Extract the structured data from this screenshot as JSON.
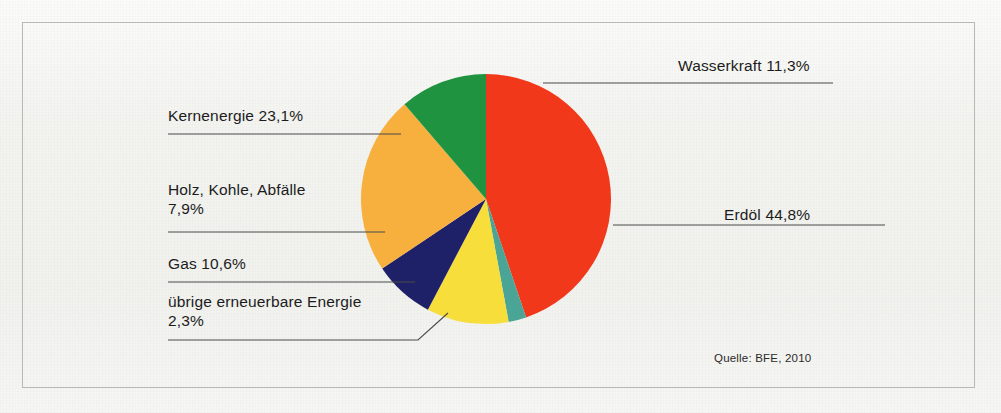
{
  "chart_data": {
    "type": "pie",
    "title": "",
    "subtitle": "",
    "xlabel": "",
    "ylabel": "",
    "legend_position": "callout-labels",
    "grid": false,
    "unit": "%",
    "total": 100.0,
    "categories": [
      "Erdöl",
      "Kernenergie",
      "Wasserkraft",
      "Gas",
      "Holz, Kohle, Abfälle",
      "übrige erneuerbare Energie"
    ],
    "values": [
      44.8,
      23.1,
      11.3,
      10.6,
      7.9,
      2.3
    ],
    "slices": [
      {
        "label": "Erdöl",
        "value": 44.8,
        "value_text": "44,8%",
        "color": "#F2381A",
        "label_text": "Erdöl 44,8%"
      },
      {
        "label": "übrige erneuerbare Energie",
        "value": 2.3,
        "value_text": "2,3%",
        "color": "#4AA596",
        "label_text": "übrige erneuerbare Energie 2,3%"
      },
      {
        "label": "Gas",
        "value": 10.6,
        "value_text": "10,6%",
        "color": "#F7DE3A",
        "label_text": "Gas 10,6%"
      },
      {
        "label": "Holz, Kohle, Abfälle",
        "value": 7.9,
        "value_text": "7,9%",
        "color": "#1E2068",
        "label_text": "Holz, Kohle, Abfälle 7,9%"
      },
      {
        "label": "Kernenergie",
        "value": 23.1,
        "value_text": "23,1%",
        "color": "#F7B03E",
        "label_text": "Kernenergie 23,1%"
      },
      {
        "label": "Wasserkraft",
        "value": 11.3,
        "value_text": "11,3%",
        "color": "#1F9340",
        "label_text": "Wasserkraft 11,3%"
      }
    ],
    "source": "Quelle: BFE, 2010"
  },
  "labels": {
    "wasserkraft": "Wasserkraft 11,3%",
    "kernenergie": "Kernenergie 23,1%",
    "holz_line1": "Holz, Kohle, Abfälle",
    "holz_line2": "7,9%",
    "gas": "Gas 10,6%",
    "uebrige_line1": "übrige erneuerbare Energie",
    "uebrige_line2": "2,3%",
    "erdoel": "Erdöl 44,8%"
  },
  "source_note": "Quelle: BFE, 2010",
  "colors": {
    "erdoel": "#F2381A",
    "kernenergie": "#F7B03E",
    "wasserkraft": "#1F9340",
    "gas": "#F7DE3A",
    "holz": "#1E2068",
    "uebrige": "#4AA596",
    "leader_line": "#4a4a4a",
    "frame": "#b9b9b4",
    "background": "#f2f2ef"
  }
}
